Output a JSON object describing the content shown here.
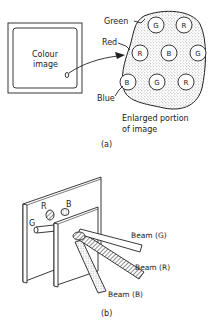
{
  "panel_a": {
    "screen_label_line1": "Colour",
    "screen_label_line2": "image",
    "callouts": {
      "green": "Green",
      "red": "Red",
      "blue": "Blue"
    },
    "enlarged_caption_line1": "Enlarged portion",
    "enlarged_caption_line2": "of image",
    "phosphor_dots": [
      {
        "label": "G"
      },
      {
        "label": "R"
      },
      {
        "label": "R"
      },
      {
        "label": "B"
      },
      {
        "label": "G"
      },
      {
        "label": "B"
      },
      {
        "label": "G"
      },
      {
        "label": "R"
      }
    ],
    "caption": "(a)"
  },
  "panel_b": {
    "gun_labels": {
      "g": "G",
      "r": "R",
      "b": "B"
    },
    "beams": {
      "g": "Beam (G)",
      "r": "Beam (R)",
      "b": "Beam (B)"
    },
    "caption": "(b)"
  }
}
